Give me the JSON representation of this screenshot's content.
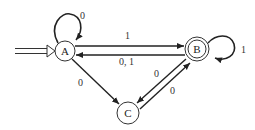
{
  "diagram": {
    "type": "finite-automaton",
    "states": [
      {
        "id": "A",
        "label": "A",
        "start": true,
        "accepting": false
      },
      {
        "id": "B",
        "label": "B",
        "start": false,
        "accepting": true
      },
      {
        "id": "C",
        "label": "C",
        "start": false,
        "accepting": false
      }
    ],
    "transitions": [
      {
        "from": "A",
        "to": "A",
        "label": "0"
      },
      {
        "from": "A",
        "to": "B",
        "label": "1"
      },
      {
        "from": "B",
        "to": "A",
        "label": "0, 1"
      },
      {
        "from": "B",
        "to": "B",
        "label": "1"
      },
      {
        "from": "A",
        "to": "C",
        "label": "0"
      },
      {
        "from": "B",
        "to": "C",
        "label": "0"
      },
      {
        "from": "C",
        "to": "B",
        "label": "0"
      }
    ]
  },
  "colors": {
    "stroke": "#222222",
    "background": "#ffffff"
  }
}
